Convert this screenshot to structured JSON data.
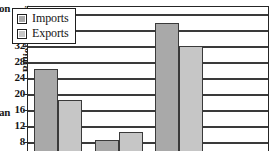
{
  "edge_fragments": {
    "top": "on",
    "middle": "an"
  },
  "legend": {
    "position": "top-left-inside",
    "items": [
      {
        "label": "Imports",
        "swatch": "imports-swatch",
        "color": "#a9a9a9"
      },
      {
        "label": "Exports",
        "swatch": "exports-swatch",
        "color": "#c6c6c6"
      }
    ]
  },
  "axis": {
    "ylabel": "Billion Dollars",
    "ticks": [
      40,
      36,
      32,
      28,
      24,
      20,
      16,
      12,
      8
    ]
  },
  "chart_data": {
    "type": "bar",
    "title": "",
    "subtitle": "",
    "xlabel": "",
    "ylabel": "Billion Dollars",
    "ylim": [
      4,
      42
    ],
    "ytick_step": 4,
    "yticks": [
      8,
      12,
      16,
      20,
      24,
      28,
      32,
      36,
      40
    ],
    "grid": true,
    "grid_axis": "y",
    "legend_position": "upper left",
    "cropped": true,
    "crop_note": "Image is cropped: x-axis category labels and chart bottom are cut off below the visible area.",
    "categories": [
      "group-1",
      "group-2",
      "group-3",
      "group-4"
    ],
    "series": [
      {
        "name": "Imports",
        "color": "#a9a9a9",
        "values": [
          26.5,
          8.7,
          38.0,
          null
        ]
      },
      {
        "name": "Exports",
        "color": "#c6c6c6",
        "values": [
          18.8,
          10.7,
          32.2,
          null
        ]
      }
    ]
  }
}
